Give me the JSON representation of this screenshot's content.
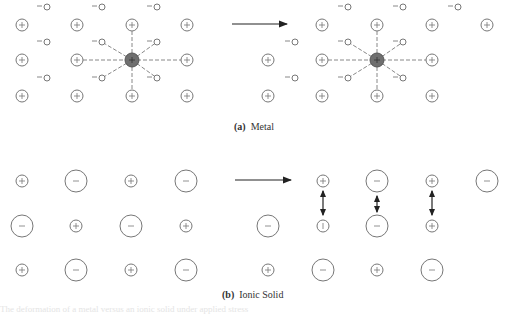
{
  "figure": {
    "panel_a": {
      "label": "(a)",
      "title": "Metal",
      "ion_symbol": "+",
      "electron_symbol": "−",
      "colors": {
        "ion_stroke": "#777777",
        "center_ion_fill": "#6f6f6f",
        "bond_dash": "#888888"
      }
    },
    "panel_b": {
      "label": "(b)",
      "title": "Ionic Solid",
      "cation_symbol": "+",
      "anion_symbol": "−",
      "displaced_symbol": "|"
    },
    "bottom_text": "The deformation of a metal versus an ionic solid under applied stress"
  }
}
